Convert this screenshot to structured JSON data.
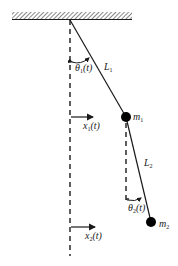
{
  "diagram": {
    "type": "double-pendulum-schematic",
    "colors": {
      "line": "#1a1a1a",
      "ceiling_hatch": "#555555",
      "background": "#ffffff"
    },
    "ceiling": {
      "x1": 12,
      "x2": 132,
      "y_top": 12,
      "y_bottom": 20
    },
    "pivot": {
      "x": 70,
      "y": 20
    },
    "reference_line": {
      "x": 70,
      "y_start": 20,
      "y_end": 256,
      "style": "dashed"
    },
    "secondary_reference_line": {
      "x": 126,
      "y_start": 122,
      "y_end": 200,
      "style": "dashed"
    },
    "masses": [
      {
        "id": "m1",
        "cx": 126,
        "cy": 117,
        "r": 5,
        "label_text": "m",
        "label_sub": "1"
      },
      {
        "id": "m2",
        "cx": 151,
        "cy": 222,
        "r": 5,
        "label_text": "m",
        "label_sub": "2"
      }
    ],
    "rods": [
      {
        "id": "L1",
        "label_text": "L",
        "label_sub": "1"
      },
      {
        "id": "L2",
        "label_text": "L",
        "label_sub": "2"
      }
    ],
    "angles": [
      {
        "id": "theta1",
        "label_text": "θ",
        "label_sub": "1",
        "label_arg": "(t)"
      },
      {
        "id": "theta2",
        "label_text": "θ",
        "label_sub": "2",
        "label_arg": "(t)"
      }
    ],
    "displacements": [
      {
        "id": "x1",
        "y": 117,
        "x_start": 71,
        "x_end": 94,
        "label_text": "x",
        "label_sub": "1",
        "label_arg": "(t)"
      },
      {
        "id": "x2",
        "y": 227,
        "x_start": 71,
        "x_end": 96,
        "label_text": "x",
        "label_sub": "2",
        "label_arg": "(t)"
      }
    ]
  }
}
